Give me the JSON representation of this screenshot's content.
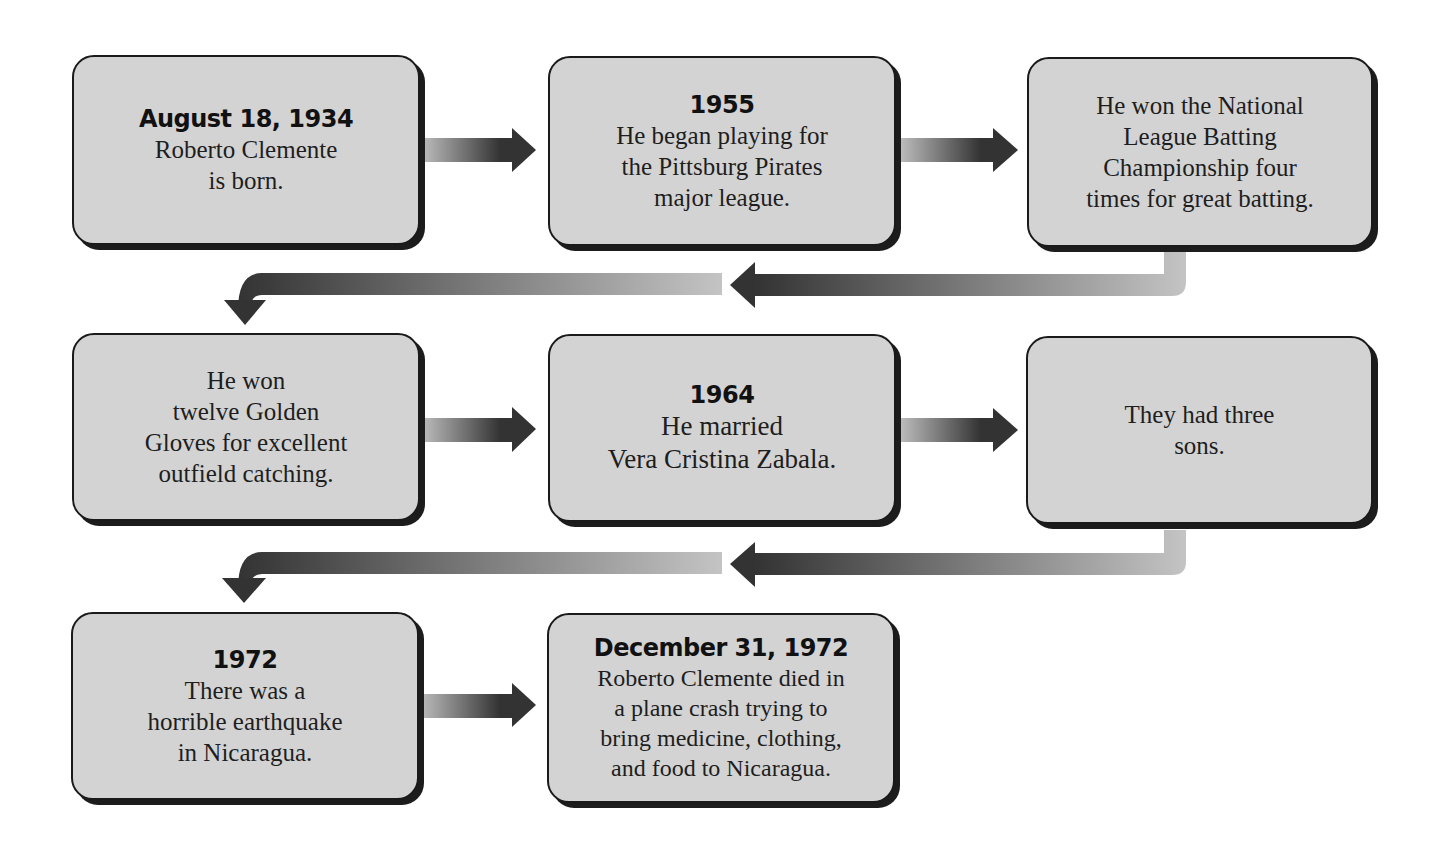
{
  "diagram": {
    "type": "flowchart-timeline",
    "subject": "Roberto Clemente",
    "colors": {
      "box_fill": "#d3d3d3",
      "box_border": "#1a1a1a",
      "arrow_dark": "#333333",
      "arrow_light": "#bdbdbd"
    },
    "events": [
      {
        "date": "August 18, 1934",
        "text": "Roberto Clemente\nis born."
      },
      {
        "date": "1955",
        "text": "He began playing for\nthe Pittsburg Pirates\nmajor league."
      },
      {
        "date": "",
        "text": "He won the National\nLeague Batting\nChampionship four\ntimes for great batting."
      },
      {
        "date": "",
        "text": "He won\ntwelve Golden\nGloves for excellent\noutfield catching."
      },
      {
        "date": "1964",
        "text": "He married\nVera Cristina Zabala."
      },
      {
        "date": "",
        "text": "They had three\nsons."
      },
      {
        "date": "1972",
        "text": "There was a\nhorrible earthquake\nin Nicaragua."
      },
      {
        "date": "December 31, 1972",
        "text": "Roberto Clemente died in\na plane crash trying to\nbring medicine, clothing,\nand food to Nicaragua."
      }
    ],
    "connections": [
      {
        "from": 0,
        "to": 1,
        "direction": "right"
      },
      {
        "from": 1,
        "to": 2,
        "direction": "right"
      },
      {
        "from": 2,
        "to": 3,
        "direction": "wrap-left-down"
      },
      {
        "from": 3,
        "to": 4,
        "direction": "right"
      },
      {
        "from": 4,
        "to": 5,
        "direction": "right"
      },
      {
        "from": 5,
        "to": 6,
        "direction": "wrap-left-down"
      },
      {
        "from": 6,
        "to": 7,
        "direction": "right"
      }
    ]
  }
}
